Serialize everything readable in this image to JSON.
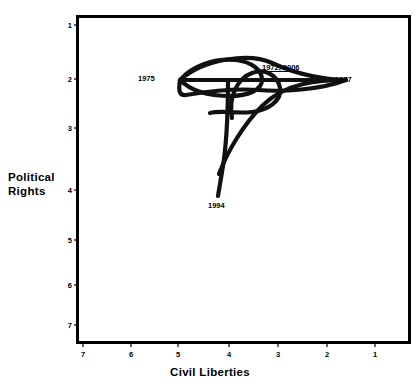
{
  "chart_data": {
    "type": "line",
    "title": "",
    "subtitle": "",
    "xlabel": "Civil Liberties",
    "ylabel": "Political Rights",
    "xticks": [
      "7",
      "6",
      "5",
      "4",
      "3",
      "2",
      "1"
    ],
    "yticks": [
      "1",
      "2",
      "3",
      "4",
      "5",
      "6",
      "7"
    ],
    "xlim": [
      7,
      1
    ],
    "ylim": [
      1,
      7
    ],
    "x_axis_reversed": true,
    "y_axis_reversed": true,
    "grid": false,
    "legend": null,
    "series": [
      {
        "name": "Freedom House trajectory",
        "x": [
          3.0,
          4.4,
          5.15,
          4.05,
          3.5,
          2.02,
          3.15,
          3.9,
          4.0,
          3.55,
          3.0
        ],
        "y": [
          2.0,
          1.62,
          2.0,
          2.35,
          2.3,
          2.0,
          2.18,
          2.95,
          4.0,
          2.55,
          2.0
        ]
      }
    ],
    "annotations": [
      {
        "text": "1975",
        "x": 5.15,
        "y": 2.0,
        "align": "right",
        "underline": false
      },
      {
        "text": "1972, 2006",
        "x": 3.0,
        "y": 2.0,
        "align": "above",
        "underline": true
      },
      {
        "text": "1977",
        "x": 2.02,
        "y": 2.0,
        "align": "left",
        "underline": false
      },
      {
        "text": "1994",
        "x": 4.0,
        "y": 4.0,
        "align": "below",
        "underline": false
      }
    ],
    "colors": {
      "line": "#111111",
      "axis": "#000000",
      "background": "#ffffff",
      "text": "#000000"
    }
  },
  "axes": {
    "y_title_line1": "Political",
    "y_title_line2": "Rights",
    "x_title": "Civil  Liberties"
  },
  "ticks": {
    "y": [
      {
        "label": "1",
        "top": 25
      },
      {
        "label": "2",
        "top": 79
      },
      {
        "label": "3",
        "top": 128
      },
      {
        "label": "4",
        "top": 190
      },
      {
        "label": "5",
        "top": 240
      },
      {
        "label": "6",
        "top": 285
      },
      {
        "label": "7",
        "top": 325
      }
    ],
    "x": [
      {
        "label": "7",
        "left": 83
      },
      {
        "label": "6",
        "left": 131
      },
      {
        "label": "5",
        "left": 178
      },
      {
        "label": "4",
        "left": 229
      },
      {
        "label": "3",
        "left": 278
      },
      {
        "label": "2",
        "left": 327
      },
      {
        "label": "1",
        "left": 375
      }
    ]
  },
  "point_labels": [
    {
      "text": "1975",
      "left": 138,
      "top": 74,
      "underline": false
    },
    {
      "text": "1972, 2006",
      "left": 262,
      "top": 63,
      "underline": true
    },
    {
      "text": "1977",
      "left": 335,
      "top": 75,
      "underline": false
    },
    {
      "text": "1994",
      "left": 208,
      "top": 201,
      "underline": false
    }
  ]
}
